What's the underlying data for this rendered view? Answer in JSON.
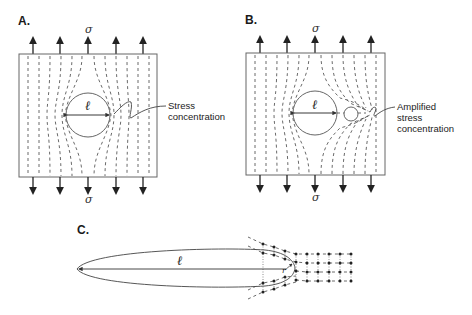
{
  "figure": {
    "panels": [
      {
        "id": "A",
        "label": "A.",
        "stress_top": "σ",
        "stress_bottom": "σ",
        "hole_dimension": "ℓ",
        "annotation": [
          "Stress",
          "concentration"
        ]
      },
      {
        "id": "B",
        "label": "B.",
        "stress_top": "σ",
        "stress_bottom": "σ",
        "hole_dimension": "ℓ",
        "annotation": [
          "Amplified",
          "stress",
          "concentration"
        ]
      },
      {
        "id": "C",
        "label": "C.",
        "crack_length": "ℓ",
        "tip_radius": "r"
      }
    ],
    "colors": {
      "line": "#444444",
      "arrow": "#222222",
      "box": "#666666",
      "background": "#ffffff"
    }
  }
}
